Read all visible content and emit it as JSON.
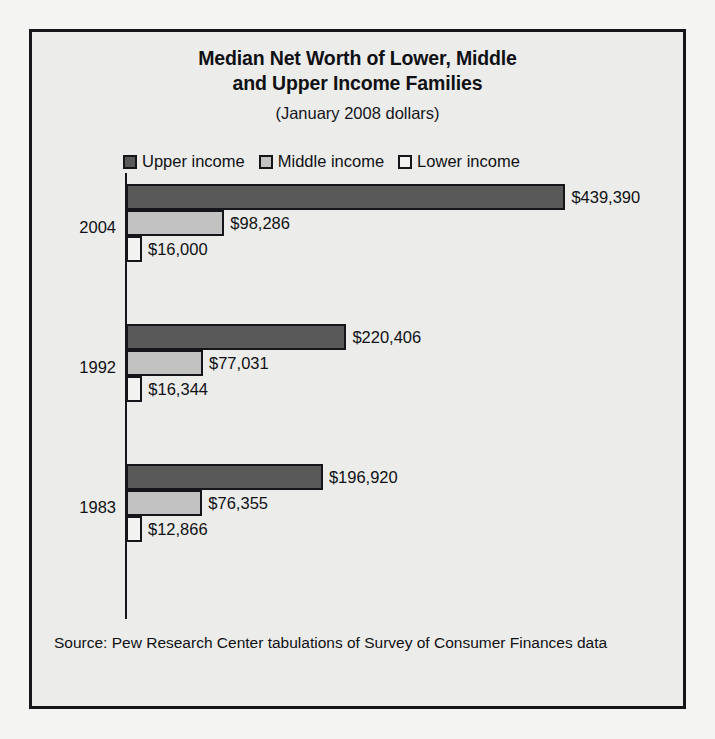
{
  "figure": {
    "title_lines": [
      "Median Net Worth of Lower, Middle",
      "and Upper Income Families"
    ],
    "subtitle": "(January 2008 dollars)",
    "source_note": "Source: Pew Research Center tabulations of Survey of Consumer Finances data"
  },
  "legend": {
    "items": [
      {
        "label": "Upper income",
        "color": "#595959"
      },
      {
        "label": "Middle income",
        "color": "#c2c2c2"
      },
      {
        "label": "Lower income",
        "color": "#f2f2f0"
      }
    ]
  },
  "groups": [
    {
      "year": "2004",
      "bars": [
        {
          "series": "Upper income",
          "value": 439390,
          "label": "$439,390"
        },
        {
          "series": "Middle income",
          "value": 98286,
          "label": "$98,286"
        },
        {
          "series": "Lower income",
          "value": 16000,
          "label": "$16,000"
        }
      ]
    },
    {
      "year": "1992",
      "bars": [
        {
          "series": "Upper income",
          "value": 220406,
          "label": "$220,406"
        },
        {
          "series": "Middle income",
          "value": 77031,
          "label": "$77,031"
        },
        {
          "series": "Lower income",
          "value": 16344,
          "label": "$16,344"
        }
      ]
    },
    {
      "year": "1983",
      "bars": [
        {
          "series": "Upper income",
          "value": 196920,
          "label": "$196,920"
        },
        {
          "series": "Middle income",
          "value": 76355,
          "label": "$76,355"
        },
        {
          "series": "Lower income",
          "value": 12866,
          "label": "$12,866"
        }
      ]
    }
  ],
  "chart_data": {
    "type": "bar",
    "orientation": "horizontal",
    "title": "Median Net Worth of Lower, Middle and Upper Income Families",
    "subtitle": "(January 2008 dollars)",
    "xlabel": "",
    "ylabel": "",
    "categories": [
      "2004",
      "1992",
      "1983"
    ],
    "series": [
      {
        "name": "Upper income",
        "color": "#595959",
        "values": [
          439390,
          220406,
          196920
        ]
      },
      {
        "name": "Middle income",
        "color": "#c2c2c2",
        "values": [
          98286,
          77031,
          76355
        ]
      },
      {
        "name": "Lower income",
        "color": "#f2f2f0",
        "values": [
          16000,
          16344,
          12866
        ]
      }
    ],
    "data_labels": [
      [
        "$439,390",
        "$98,286",
        "$16,000"
      ],
      [
        "$220,406",
        "$77,031",
        "$16,344"
      ],
      [
        "$196,920",
        "$76,355",
        "$12,866"
      ]
    ],
    "xlim": [
      0,
      460000
    ],
    "grid": false,
    "legend_position": "top",
    "units": "January 2008 dollars",
    "source": "Source: Pew Research Center tabulations of Survey of Consumer Finances data"
  },
  "render": {
    "px_per_dollar": 0.001,
    "group_tops": [
      152,
      292,
      432
    ],
    "bar_height": 26,
    "year_label_tops": [
      186,
      326,
      466
    ]
  }
}
